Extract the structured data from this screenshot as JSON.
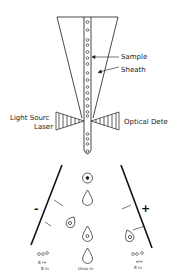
{
  "diagram": {
    "labels": {
      "sample": "Sample",
      "sheath": "Sheath",
      "light_source": "Light Sourc",
      "laser": "Laser",
      "optical_detector": "Optical Dete"
    },
    "plates": {
      "negative_sign": "-",
      "positive_sign": "+"
    },
    "bottom_labels": {
      "left_line1": "ooo",
      "left_line2": "B  I+",
      "left_line3": "B m",
      "center": "Unso m",
      "right_line1": "ooo",
      "right_line2": "ei+",
      "right_line3": "B m"
    },
    "colors": {
      "line": "#1a1a1a",
      "background": "#ffffff"
    }
  }
}
